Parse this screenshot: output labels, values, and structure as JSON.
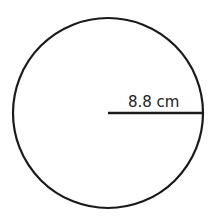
{
  "diagram": {
    "shape": "circle",
    "radius_label": "8.8 cm",
    "stroke_color": "#1a1a1a",
    "background": "#ffffff"
  }
}
